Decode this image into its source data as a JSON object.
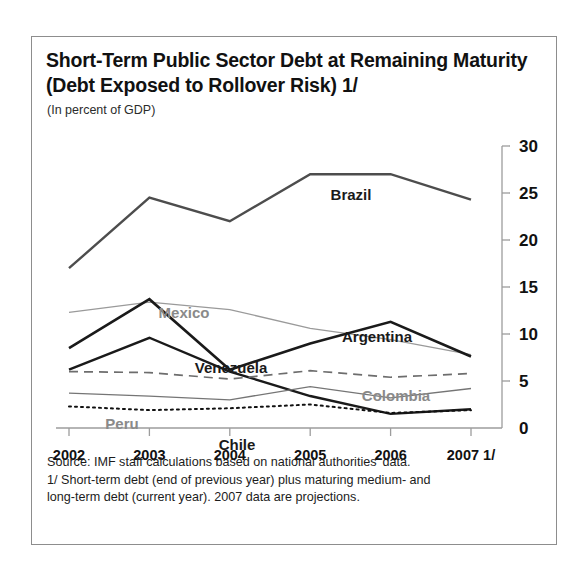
{
  "figure": {
    "title": "Short-Term Public Sector Debt at Remaining Maturity (Debt Exposed to Rollover Risk) 1/",
    "subtitle": "(In percent of GDP)",
    "footnotes": [
      "Source: IMF staff calculations based on national authorities' data.",
      "1/ Short-term debt (end of previous year) plus maturing medium- and",
      "long-term debt (current year). 2007 data are projections."
    ]
  },
  "chart_data": {
    "type": "line",
    "title": "Short-Term Public Sector Debt at Remaining Maturity (Debt Exposed to Rollover Risk) 1/",
    "subtitle": "(In percent of GDP)",
    "xlabel": "",
    "ylabel": "(In percent of GDP)",
    "x": [
      "2002",
      "2003",
      "2004",
      "2005",
      "2006",
      "2007 1/"
    ],
    "xtick_labels": [
      "2002",
      "2003",
      "2004",
      "2005",
      "2006",
      "2007 1/"
    ],
    "ytick_labels": [
      "0",
      "5",
      "10",
      "15",
      "20",
      "25",
      "30"
    ],
    "ytick_values": [
      0,
      5,
      10,
      15,
      20,
      25,
      30
    ],
    "ylim": [
      0,
      30
    ],
    "grid": false,
    "legend": "inline-labels",
    "axis_position": "right",
    "series": [
      {
        "name": "Brazil",
        "values": [
          17.0,
          24.5,
          22.0,
          27.0,
          27.0,
          24.3
        ],
        "color": "#4d4d4d",
        "style": "solid",
        "width": 2.4,
        "label_x": 319,
        "label_y": 163
      },
      {
        "name": "Mexico",
        "values": [
          12.3,
          13.4,
          12.6,
          10.6,
          9.4,
          7.8
        ],
        "color": "#9a9a9a",
        "style": "solid",
        "width": 1.3,
        "label_x": 152,
        "label_y": 281
      },
      {
        "name": "Argentina",
        "values": [
          8.5,
          13.7,
          6.2,
          9.0,
          11.3,
          7.6
        ],
        "color": "#1a1a1a",
        "style": "solid",
        "width": 2.6,
        "label_x": 345,
        "label_y": 305
      },
      {
        "name": "Venezuela",
        "values": [
          6.2,
          9.6,
          6.0,
          3.4,
          1.5,
          2.0
        ],
        "color": "#1a1a1a",
        "style": "solid",
        "width": 2.4,
        "label_x": 199,
        "label_y": 336
      },
      {
        "name": "Colombia",
        "values": [
          6.0,
          5.9,
          5.2,
          6.1,
          5.4,
          5.8
        ],
        "color": "#6d6d6d",
        "style": "dashed",
        "width": 1.7,
        "label_x": 364,
        "label_y": 364
      },
      {
        "name": "Peru",
        "values": [
          3.7,
          3.4,
          3.0,
          4.4,
          3.2,
          4.2
        ],
        "color": "#757575",
        "style": "solid",
        "width": 1.3,
        "label_x": 90,
        "label_y": 392
      },
      {
        "name": "Chile",
        "values": [
          2.3,
          1.9,
          2.1,
          2.5,
          1.6,
          1.9
        ],
        "color": "#111111",
        "style": "dotted",
        "width": 2.0,
        "label_x": 205,
        "label_y": 413
      }
    ]
  }
}
